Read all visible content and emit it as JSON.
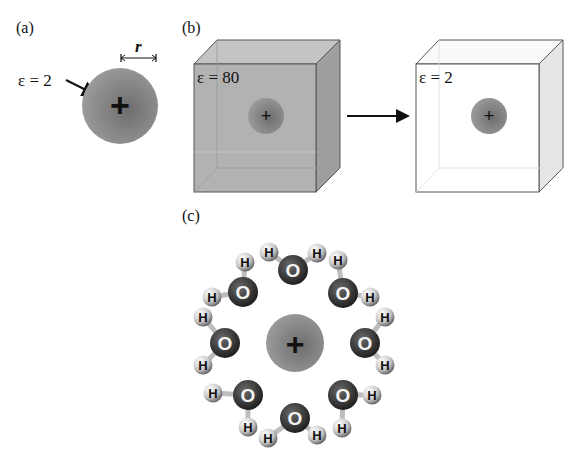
{
  "figure": {
    "panels": {
      "a": {
        "label": "(a)",
        "epsilon_label": "ε = 2",
        "radius_label": "r",
        "ion_sign": "+"
      },
      "b": {
        "label": "(b)",
        "left_box": {
          "epsilon_label": "ε = 80",
          "ion_sign": "+"
        },
        "right_box": {
          "epsilon_label": "ε = 2",
          "ion_sign": "+"
        }
      },
      "c": {
        "label": "(c)",
        "ion_sign": "+",
        "oxygen_label": "O",
        "hydrogen_label": "H",
        "water_molecule_count": 8
      }
    },
    "colors": {
      "ion": "#8c8c8c",
      "box_solvent": "#b4b4b4",
      "box_vacuum": "#ffffff",
      "oxygen": "#3a3a3a",
      "hydrogen": "#d8d8d8"
    }
  }
}
